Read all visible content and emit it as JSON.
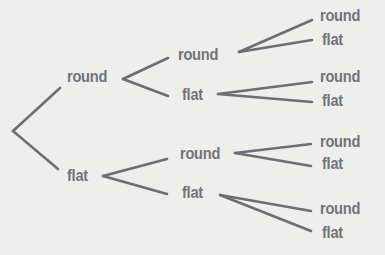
{
  "diagram": {
    "type": "tree",
    "colors": {
      "background": "#eeeeec",
      "line": "#6e6e72",
      "text": "#737377"
    },
    "level1": {
      "round": "round",
      "flat": "flat"
    },
    "level2": {
      "round_round": "round",
      "round_flat": "flat",
      "flat_round": "round",
      "flat_flat": "flat"
    },
    "level3": {
      "rr_round": "round",
      "rr_flat": "flat",
      "rf_round": "round",
      "rf_flat": "flat",
      "fr_round": "round",
      "fr_flat": "flat",
      "ff_round": "round",
      "ff_flat": "flat"
    }
  }
}
